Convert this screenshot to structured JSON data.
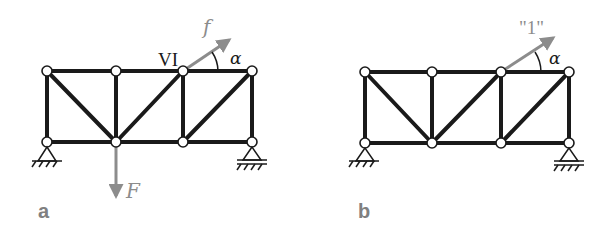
{
  "figure": {
    "panels": [
      {
        "id": "a",
        "label": "a",
        "node_label": "VI",
        "angle_label": "α",
        "applied_force_label": "f",
        "external_load_label": "F",
        "supports": [
          "pin",
          "roller"
        ]
      },
      {
        "id": "b",
        "label": "b",
        "angle_label": "α",
        "unit_load_label": "\"1\"",
        "supports": [
          "pin",
          "roller"
        ]
      }
    ],
    "colors": {
      "members": "#1a1a1a",
      "forces": "#8c8c8c",
      "panel_labels": "#808080",
      "background": "#ffffff"
    }
  }
}
